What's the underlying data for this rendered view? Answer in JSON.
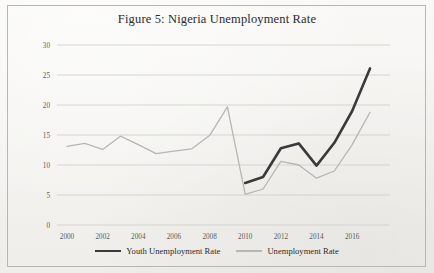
{
  "figure": {
    "title": "Figure 5: Nigeria Unemployment Rate"
  },
  "legend": {
    "position": "bottom-center",
    "entries": [
      {
        "label": "Youth Unemployment Rate",
        "color": "#3a3a3a",
        "style": "thick"
      },
      {
        "label": "Unemployment Rate",
        "color": "#b7b6b2",
        "style": "thin"
      }
    ]
  },
  "axis": {
    "y_ticks": [
      "0",
      "5",
      "10",
      "15",
      "20",
      "25",
      "30"
    ],
    "x_ticks": [
      "2000",
      "2002",
      "2004",
      "2006",
      "2008",
      "2010",
      "2012",
      "2014",
      "2016"
    ]
  },
  "chart_data": {
    "type": "line",
    "title": "Figure 5: Nigeria Unemployment Rate",
    "xlabel": "",
    "ylabel": "",
    "xlim": [
      2000,
      2017
    ],
    "ylim": [
      0,
      30
    ],
    "grid": true,
    "grid_axis": "y",
    "legend_position": "bottom-center",
    "x": [
      2000,
      2001,
      2002,
      2003,
      2004,
      2005,
      2006,
      2007,
      2008,
      2009,
      2010,
      2011,
      2012,
      2013,
      2014,
      2015,
      2016,
      2017
    ],
    "series": [
      {
        "name": "Unemployment Rate",
        "color": "#b7b6b2",
        "width": 1.3,
        "x": [
          2000,
          2001,
          2002,
          2003,
          2004,
          2005,
          2006,
          2007,
          2008,
          2009,
          2010,
          2011,
          2012,
          2013,
          2014,
          2015,
          2016,
          2017
        ],
        "values": [
          13.1,
          13.6,
          12.6,
          14.8,
          13.4,
          11.9,
          12.3,
          12.7,
          14.9,
          19.7,
          5.1,
          6.0,
          10.6,
          10.0,
          7.8,
          9.0,
          13.4,
          18.8
        ]
      },
      {
        "name": "Youth Unemployment Rate",
        "color": "#3a3a3a",
        "width": 2.6,
        "x": [
          2010,
          2011,
          2012,
          2013,
          2014,
          2015,
          2016,
          2017
        ],
        "values": [
          7.0,
          8.0,
          12.8,
          13.6,
          9.9,
          13.7,
          19.0,
          26.1
        ]
      }
    ]
  }
}
